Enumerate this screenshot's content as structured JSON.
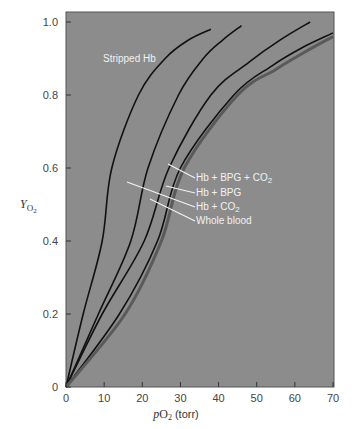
{
  "chart_data": {
    "type": "line",
    "title": "",
    "xlabel": "pO2 (torr)",
    "ylabel": "YO2",
    "xlim": [
      0,
      70
    ],
    "ylim": [
      0,
      1.0
    ],
    "xticks": [
      0,
      10,
      20,
      30,
      40,
      50,
      60,
      70
    ],
    "yticks": [
      0,
      0.2,
      0.4,
      0.6,
      0.8,
      1.0
    ],
    "xtick_labels": [
      "0",
      "10",
      "20",
      "30",
      "40",
      "50",
      "60",
      "70"
    ],
    "ytick_labels": [
      "0",
      "0.2",
      "0.4",
      "0.6",
      "0.8",
      "1.0"
    ],
    "grid": false,
    "background": "#8c8c8c",
    "series": [
      {
        "name": "Stripped Hb",
        "color": "#111111",
        "x": [
          0,
          4.5,
          9.5,
          12,
          19,
          26,
          32,
          38
        ],
        "y": [
          0,
          0.2,
          0.4,
          0.6,
          0.8,
          0.9,
          0.95,
          0.98
        ]
      },
      {
        "name": "Hb + BPG",
        "color": "#111111",
        "x": [
          0,
          8.5,
          17,
          21.5,
          29.5,
          36,
          41,
          46
        ],
        "y": [
          0,
          0.2,
          0.4,
          0.6,
          0.8,
          0.9,
          0.95,
          0.99
        ]
      },
      {
        "name": "Hb + CO2",
        "color": "#111111",
        "x": [
          0,
          9.5,
          20.5,
          27,
          38,
          48,
          56,
          64
        ],
        "y": [
          0,
          0.2,
          0.4,
          0.6,
          0.8,
          0.89,
          0.95,
          1.0
        ]
      },
      {
        "name": "Hb + BPG + CO2",
        "color": "#111111",
        "x": [
          0,
          14,
          24,
          30,
          44,
          54,
          62,
          70
        ],
        "y": [
          0,
          0.2,
          0.4,
          0.6,
          0.8,
          0.88,
          0.93,
          0.97
        ]
      },
      {
        "name": "Whole blood",
        "color": "#5a5a5a",
        "x": [
          0,
          15.5,
          25,
          31,
          45,
          55,
          63,
          70
        ],
        "y": [
          0,
          0.2,
          0.4,
          0.6,
          0.8,
          0.87,
          0.92,
          0.96
        ]
      }
    ],
    "annotations": [
      {
        "text": "Stripped Hb",
        "x": 11,
        "y": 0.9
      },
      {
        "text": "Hb + BPG + CO2",
        "x": 37,
        "y": 0.61
      },
      {
        "text": "Hb + BPG",
        "x": 37,
        "y": 0.565
      },
      {
        "text": "Hb + CO2",
        "x": 37,
        "y": 0.52
      },
      {
        "text": "Whole blood",
        "x": 37,
        "y": 0.475
      }
    ]
  },
  "labels": {
    "stripped": "Stripped Hb",
    "hb_bpg_co2_prefix": "Hb + BPG + CO",
    "hb_bpg": "Hb + BPG",
    "hb_co2_prefix": "Hb + CO",
    "whole_blood": "Whole blood",
    "sub2": "2",
    "ylabel_main": "Y",
    "ylabel_sub": "O2",
    "xlabel_p": "p",
    "xlabel_o": "O",
    "xlabel_unit": " (torr)"
  }
}
